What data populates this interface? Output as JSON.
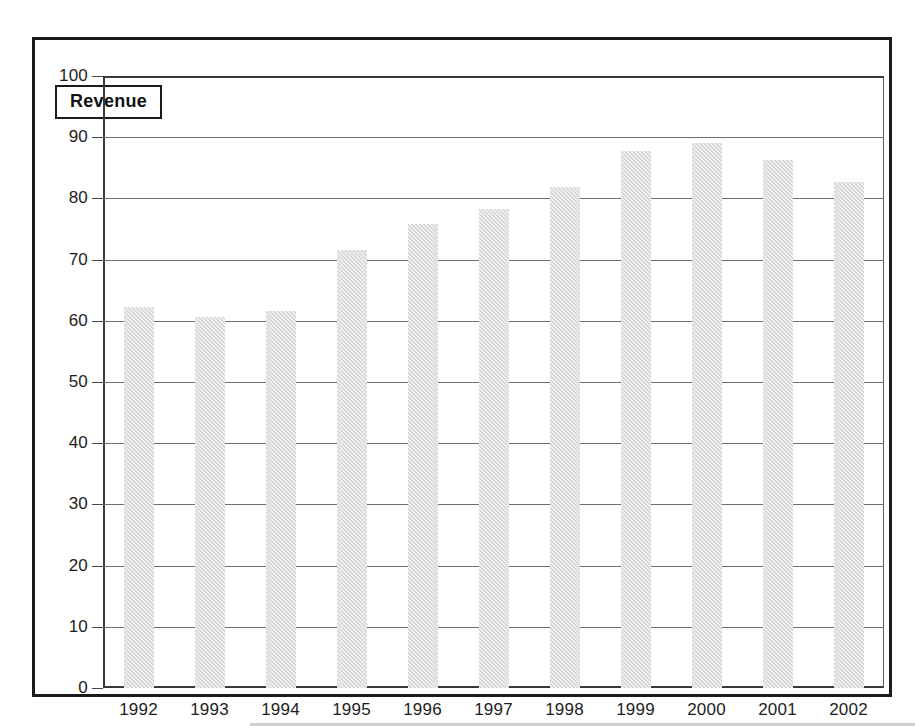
{
  "chart_data": {
    "type": "bar",
    "title": "",
    "subtitle": "",
    "xlabel": "",
    "ylabel": "",
    "legend": [
      "Revenue"
    ],
    "legend_position": "inside-top-left",
    "grid": true,
    "ylim": [
      0,
      100
    ],
    "ytick_step": 10,
    "yticks": [
      "100",
      "90",
      "80",
      "70",
      "60",
      "50",
      "40",
      "30",
      "20",
      "10",
      "0"
    ],
    "categories": [
      "1992",
      "1993",
      "1994",
      "1995",
      "1996",
      "1997",
      "1998",
      "1999",
      "2000",
      "2001",
      "2002"
    ],
    "series": [
      {
        "name": "Revenue",
        "values": [
          62.3,
          60.7,
          61.6,
          71.6,
          75.8,
          78.3,
          81.9,
          87.8,
          89.0,
          86.3,
          82.7
        ]
      }
    ],
    "colors": {
      "bar_fill": "#d9d9d9",
      "axis": "#3a3a3a",
      "gridline": "#6e6e6e",
      "frame": "#1b1b1b",
      "text": "#1d1d1d",
      "background": "#ffffff"
    }
  }
}
